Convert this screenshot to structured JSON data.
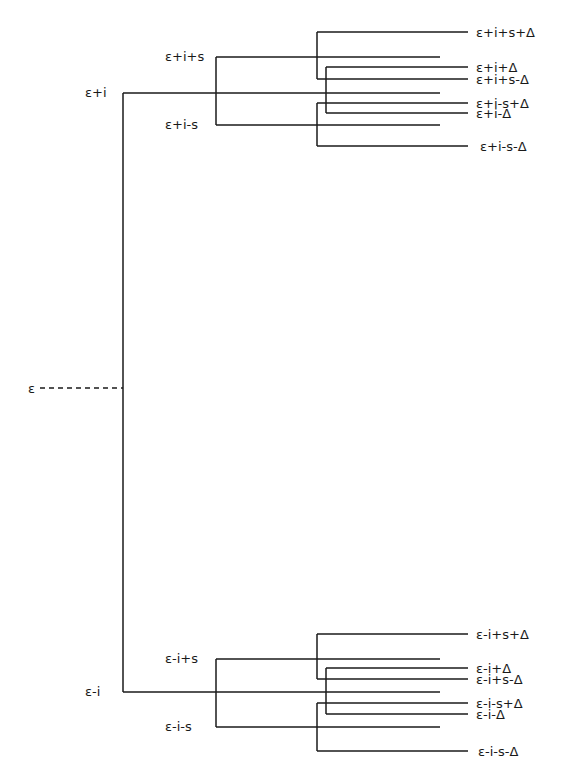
{
  "diagram": {
    "title": "",
    "colors": {
      "ink": "#1a1a1a",
      "background": "#ffffff"
    },
    "root": {
      "label": "ε-------",
      "text": "ε",
      "x": 28,
      "y": 388,
      "trunk_x": 123,
      "dash_from": 40,
      "dash_to": 123
    },
    "trunk": {
      "x": 123,
      "y_top": 93,
      "y_bottom": 692
    },
    "groups": [
      {
        "name": "plus-i",
        "label": "ε+i",
        "label_x": 85,
        "label_y": 97,
        "y": 93,
        "end_x": 440,
        "s_connector_x": 216,
        "s_branches": [
          {
            "label": "ε+i+s",
            "label_x": 165,
            "label_y": 61,
            "y": 57,
            "end_x": 440
          },
          {
            "label": "ε+i-s",
            "label_x": 165,
            "label_y": 129,
            "y": 125,
            "end_x": 440
          }
        ],
        "delta_connectors": [
          {
            "x": 317,
            "y_top": 32,
            "y_bottom": 79
          },
          {
            "x": 326,
            "y_top": 67,
            "y_bottom": 113
          },
          {
            "x": 317,
            "y_top": 103,
            "y_bottom": 146
          }
        ],
        "leaves": [
          {
            "label": "ε+i+s+Δ",
            "y": 32,
            "x_start": 317,
            "label_x": 476
          },
          {
            "label": "ε+i+Δ",
            "y": 67,
            "x_start": 326,
            "label_x": 476
          },
          {
            "label": "ε+i+s-Δ",
            "y": 79,
            "x_start": 317,
            "label_x": 476
          },
          {
            "label": "ε+i-s+Δ",
            "y": 103,
            "x_start": 317,
            "label_x": 476
          },
          {
            "label": "ε+i-Δ",
            "y": 113,
            "x_start": 326,
            "label_x": 476
          },
          {
            "label": "ε+i-s-Δ",
            "y": 146,
            "x_start": 317,
            "label_x": 480
          }
        ]
      },
      {
        "name": "minus-i",
        "label": "ε-i",
        "label_x": 85,
        "label_y": 696,
        "y": 692,
        "end_x": 440,
        "s_connector_x": 216,
        "s_branches": [
          {
            "label": "ε-i+s",
            "label_x": 165,
            "label_y": 663,
            "y": 659,
            "end_x": 440
          },
          {
            "label": "ε-i-s",
            "label_x": 165,
            "label_y": 731,
            "y": 727,
            "end_x": 440
          }
        ],
        "delta_connectors": [
          {
            "x": 317,
            "y_top": 634,
            "y_bottom": 679
          },
          {
            "x": 326,
            "y_top": 668,
            "y_bottom": 714
          },
          {
            "x": 317,
            "y_top": 703,
            "y_bottom": 751
          }
        ],
        "leaves": [
          {
            "label": "ε-i+s+Δ",
            "y": 634,
            "x_start": 317,
            "label_x": 476
          },
          {
            "label": "ε-i+Δ",
            "y": 668,
            "x_start": 326,
            "label_x": 476
          },
          {
            "label": "ε-i+s-Δ",
            "y": 679,
            "x_start": 317,
            "label_x": 476
          },
          {
            "label": "ε-i-s+Δ",
            "y": 703,
            "x_start": 317,
            "label_x": 476
          },
          {
            "label": "ε-i-Δ",
            "y": 714,
            "x_start": 326,
            "label_x": 476
          },
          {
            "label": "ε-i-s-Δ",
            "y": 751,
            "x_start": 317,
            "label_x": 478
          }
        ]
      }
    ],
    "leaf_end_x": 468
  }
}
